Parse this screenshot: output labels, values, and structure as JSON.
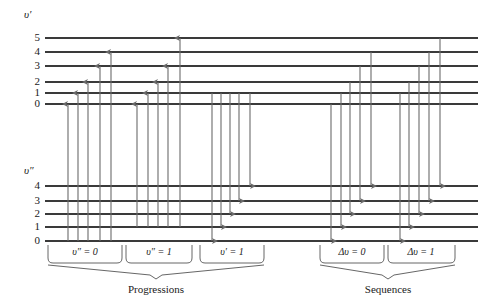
{
  "figure": {
    "type": "energy-level-transition-diagram",
    "background_color": "#ffffff",
    "line_color": "#3a3a3a",
    "arrow_color": "#6b6b6b",
    "text_color": "#1a1a1a"
  },
  "upper_state": {
    "symbol": "υ′",
    "levels": [
      "5",
      "4",
      "3",
      "2",
      "1",
      "0"
    ]
  },
  "lower_state": {
    "symbol": "υ″",
    "levels": [
      "4",
      "3",
      "2",
      "1",
      "0"
    ]
  },
  "brackets": [
    {
      "label": "υ″ = 0"
    },
    {
      "label": "υ″ = 1"
    },
    {
      "label": "υ′ = 1"
    },
    {
      "label": "Δυ = 0"
    },
    {
      "label": "Δυ = 1"
    }
  ],
  "captions": [
    {
      "label": "Progressions"
    },
    {
      "label": "Sequences"
    }
  ],
  "chart_data": {
    "type": "diagram",
    "title": "",
    "upper_level_y": {
      "5": 38,
      "4": 52,
      "3": 66,
      "2": 82,
      "1": 93,
      "0": 104
    },
    "lower_level_y": {
      "4": 186,
      "3": 201,
      "2": 214,
      "1": 227,
      "0": 241
    },
    "level_x_start": 45,
    "level_x_end": 478,
    "groups": [
      {
        "name": "υ″ = 0",
        "direction": "up",
        "transitions": [
          {
            "x": 68,
            "from": "v''0",
            "to": "v'0"
          },
          {
            "x": 78,
            "from": "v''0",
            "to": "v'1"
          },
          {
            "x": 88,
            "from": "v''0",
            "to": "v'2"
          },
          {
            "x": 100,
            "from": "v''0",
            "to": "v'3"
          },
          {
            "x": 111,
            "from": "v''0",
            "to": "v'4"
          }
        ]
      },
      {
        "name": "υ″ = 1",
        "direction": "up",
        "transitions": [
          {
            "x": 137,
            "from": "v''1",
            "to": "v'0"
          },
          {
            "x": 148,
            "from": "v''1",
            "to": "v'1"
          },
          {
            "x": 158,
            "from": "v''1",
            "to": "v'2"
          },
          {
            "x": 168,
            "from": "v''1",
            "to": "v'3"
          },
          {
            "x": 180,
            "from": "v''1",
            "to": "v'5"
          }
        ]
      },
      {
        "name": "υ′ = 1",
        "direction": "down",
        "transitions": [
          {
            "x": 212,
            "from": "v'1",
            "to": "v''0"
          },
          {
            "x": 221,
            "from": "v'1",
            "to": "v''1"
          },
          {
            "x": 230,
            "from": "v'1",
            "to": "v''2"
          },
          {
            "x": 239,
            "from": "v'1",
            "to": "v''3"
          },
          {
            "x": 250,
            "from": "v'1",
            "to": "v''4"
          }
        ]
      },
      {
        "name": "Δυ = 0",
        "direction": "down",
        "transitions": [
          {
            "x": 331,
            "from": "v'0",
            "to": "v''0"
          },
          {
            "x": 341,
            "from": "v'1",
            "to": "v''1"
          },
          {
            "x": 350,
            "from": "v'2",
            "to": "v''2"
          },
          {
            "x": 360,
            "from": "v'3",
            "to": "v''3"
          },
          {
            "x": 371,
            "from": "v'4",
            "to": "v''4"
          }
        ]
      },
      {
        "name": "Δυ = 1",
        "direction": "down",
        "transitions": [
          {
            "x": 400,
            "from": "v'1",
            "to": "v''0"
          },
          {
            "x": 409,
            "from": "v'2",
            "to": "v''1"
          },
          {
            "x": 419,
            "from": "v'3",
            "to": "v''2"
          },
          {
            "x": 429,
            "from": "v'4",
            "to": "v''3"
          },
          {
            "x": 440,
            "from": "v'5",
            "to": "v''4"
          }
        ]
      }
    ]
  }
}
